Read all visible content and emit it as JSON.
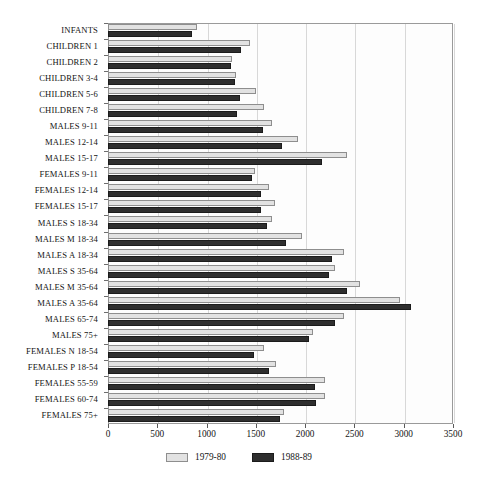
{
  "chart_data": {
    "type": "bar",
    "orientation": "horizontal",
    "title": "",
    "subtitle": "",
    "xlabel": "",
    "ylabel": "",
    "xlim": [
      0,
      3500
    ],
    "xticks": [
      0,
      500,
      1000,
      1500,
      2000,
      2500,
      3000,
      3500
    ],
    "xticklabels": [
      "0",
      "500",
      "1000",
      "1500",
      "2000",
      "2500",
      "3000",
      "3500"
    ],
    "grid": true,
    "legend_position": "bottom-center",
    "categories": [
      "INFANTS",
      "CHILDREN 1",
      "CHILDREN 2",
      "CHILDREN 3-4",
      "CHILDREN 5-6",
      "CHILDREN 7-8",
      "MALES 9-11",
      "MALES 12-14",
      "MALES 15-17",
      "FEMALES 9-11",
      "FEMALES 12-14",
      "FEMALES 15-17",
      "MALES S 18-34",
      "MALES M 18-34",
      "MALES A 18-34",
      "MALES S 35-64",
      "MALES M 35-64",
      "MALES A 35-64",
      "MALES 65-74",
      "MALES 75+",
      "FEMALES N 18-54",
      "FEMALES P 18-54",
      "FEMALES 55-59",
      "FEMALES 60-74",
      "FEMALES 75+"
    ],
    "series": [
      {
        "name": "1979-80",
        "color": "#e2e2e2",
        "values": [
          905,
          1445,
          1260,
          1300,
          1505,
          1585,
          1665,
          1925,
          2425,
          1490,
          1630,
          1690,
          1660,
          1970,
          2395,
          2305,
          2555,
          2960,
          2390,
          2080,
          1580,
          1700,
          2205,
          2200,
          1790
        ]
      },
      {
        "name": "1988-89",
        "color": "#2e2e2e",
        "values": [
          855,
          1350,
          1250,
          1285,
          1340,
          1305,
          1570,
          1770,
          2170,
          1460,
          1555,
          1555,
          1610,
          1805,
          2275,
          2245,
          2420,
          3075,
          2305,
          2040,
          1480,
          1635,
          2100,
          2110,
          1745
        ]
      }
    ]
  },
  "legend": {
    "items": [
      {
        "label": "1979-80",
        "swatch": "light"
      },
      {
        "label": "1988-89",
        "swatch": "dark"
      }
    ]
  },
  "colors": {
    "series_1979_80": "#e2e2e2",
    "series_1988_89": "#2e2e2e",
    "axis": "#9a9a9a",
    "grid": "#d8d8d8",
    "text": "#141414",
    "background": "#ffffff"
  }
}
